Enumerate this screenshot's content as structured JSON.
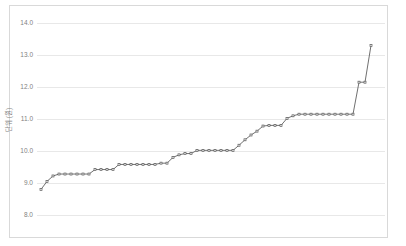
{
  "chart_data": {
    "type": "line",
    "title": "",
    "subtitle": "",
    "xlabel": "",
    "ylabel": "단위 (원)",
    "ylim": [
      8.0,
      14.0
    ],
    "ytick_labels": [
      "14.0",
      "13.0",
      "12.0",
      "11.0",
      "10.0",
      "9.0",
      "8.0"
    ],
    "ytick_values": [
      14.0,
      13.0,
      12.0,
      11.0,
      10.0,
      9.0,
      8.0
    ],
    "xtick_labels": [],
    "grid": "horizontal",
    "legend": "none",
    "marker": "open-square",
    "line_color": "#606060",
    "marker_fill": "#ffffff",
    "marker_stroke": "#5a5a5a",
    "grid_color": "#e8e8e8",
    "frame_color": "#d9d9d9",
    "series": [
      {
        "name": "series-1",
        "values": [
          8.8,
          9.05,
          9.22,
          9.28,
          9.28,
          9.28,
          9.28,
          9.28,
          9.28,
          9.42,
          9.42,
          9.42,
          9.42,
          9.58,
          9.58,
          9.58,
          9.58,
          9.58,
          9.58,
          9.58,
          9.62,
          9.62,
          9.8,
          9.88,
          9.92,
          9.92,
          10.02,
          10.02,
          10.02,
          10.02,
          10.02,
          10.02,
          10.02,
          10.18,
          10.35,
          10.5,
          10.62,
          10.78,
          10.8,
          10.8,
          10.8,
          11.02,
          11.1,
          11.15,
          11.15,
          11.15,
          11.15,
          11.15,
          11.15,
          11.15,
          11.15,
          11.15,
          11.15,
          12.15,
          12.15,
          13.3
        ]
      }
    ]
  },
  "axis": {
    "y_title": "단위 (원)"
  }
}
